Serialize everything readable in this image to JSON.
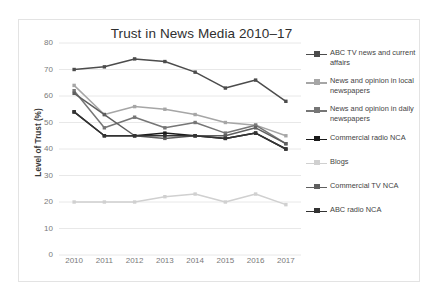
{
  "chart_data": {
    "type": "line",
    "title": "Trust in News Media 2010–17",
    "xlabel": "",
    "ylabel": "Level of Trust (%)",
    "ylim": [
      0,
      80
    ],
    "ytick_step": 10,
    "yticks": [
      "0",
      "10",
      "20",
      "30",
      "40",
      "50",
      "60",
      "70",
      "80"
    ],
    "grid": true,
    "legend_position": "right",
    "categories": [
      "2010",
      "2011",
      "2012",
      "2013",
      "2014",
      "2015",
      "2016",
      "2017"
    ],
    "series": [
      {
        "name": "ABC TV news and current affairs",
        "color": "#4c4c4c",
        "values": [
          70,
          71,
          74,
          73,
          69,
          63,
          66,
          58
        ]
      },
      {
        "name": "News and opinion in local newspapers",
        "color": "#a6a6a6",
        "values": [
          64,
          53,
          56,
          55,
          53,
          50,
          49,
          45
        ]
      },
      {
        "name": "News and opinion in daily newspapers",
        "color": "#767676",
        "values": [
          62,
          48,
          52,
          48,
          50,
          46,
          49,
          42
        ]
      },
      {
        "name": "Commercial radio NCA",
        "color": "#1a1a1a",
        "values": [
          54,
          45,
          45,
          46,
          45,
          44,
          46,
          40
        ]
      },
      {
        "name": "Blogs",
        "color": "#d0d0d0",
        "values": [
          20,
          20,
          20,
          22,
          23,
          20,
          23,
          19
        ]
      },
      {
        "name": "Commercial TV NCA",
        "color": "#5f5f5f",
        "values": [
          61,
          53,
          45,
          44,
          45,
          45,
          48,
          42
        ]
      },
      {
        "name": "ABC radio NCA",
        "color": "#333333",
        "values": [
          54,
          45,
          45,
          45,
          45,
          44,
          46,
          40
        ]
      }
    ]
  },
  "legend": {
    "items": [
      {
        "label": "ABC TV news and current affairs"
      },
      {
        "label": "News and opinion in local newspapers"
      },
      {
        "label": "News and opinion in daily newspapers"
      },
      {
        "label": "Commercial radio NCA"
      },
      {
        "label": "Blogs"
      },
      {
        "label": "Commercial TV NCA"
      },
      {
        "label": "ABC radio NCA"
      }
    ]
  }
}
